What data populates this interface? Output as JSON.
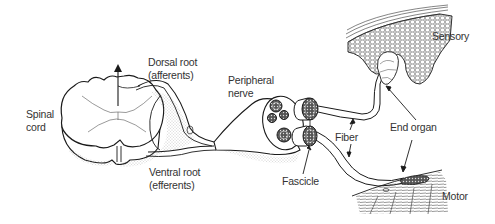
{
  "diagram": {
    "stroke_color": "#1a1a1a",
    "fill_color": "#ffffff",
    "stipple_color": "#9a9a9a",
    "labels": {
      "spinal_cord": [
        "Spinal",
        "cord"
      ],
      "dorsal_root": [
        "Dorsal root",
        "(afferents)"
      ],
      "ventral_root": [
        "Ventral root",
        "(efferents)"
      ],
      "peripheral_nerve": [
        "Peripheral",
        "nerve"
      ],
      "fascicle": "Fascicle",
      "fiber": "Fiber",
      "end_organ": "End organ",
      "sensory": "Sensory",
      "motor": "Motor"
    },
    "nodes": [
      {
        "id": "spinal-cord",
        "label": "Spinal cord"
      },
      {
        "id": "dorsal-root",
        "label": "Dorsal root (afferents)"
      },
      {
        "id": "ventral-root",
        "label": "Ventral root (efferents)"
      },
      {
        "id": "peripheral-nerve",
        "label": "Peripheral nerve"
      },
      {
        "id": "fascicle",
        "label": "Fascicle"
      },
      {
        "id": "fiber",
        "label": "Fiber"
      },
      {
        "id": "end-organ-sensory",
        "label": "End organ (Sensory)"
      },
      {
        "id": "end-organ-motor",
        "label": "End organ (Motor)"
      }
    ],
    "edges": [
      {
        "from": "spinal-cord",
        "to": "dorsal-root"
      },
      {
        "from": "spinal-cord",
        "to": "ventral-root"
      },
      {
        "from": "dorsal-root",
        "to": "peripheral-nerve"
      },
      {
        "from": "ventral-root",
        "to": "peripheral-nerve"
      },
      {
        "from": "peripheral-nerve",
        "to": "fascicle"
      },
      {
        "from": "fascicle",
        "to": "fiber"
      },
      {
        "from": "fiber",
        "to": "end-organ-sensory"
      },
      {
        "from": "fiber",
        "to": "end-organ-motor"
      }
    ]
  }
}
